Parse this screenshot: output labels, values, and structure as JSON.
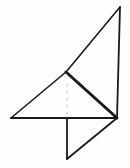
{
  "figure": {
    "type": "line-diagram",
    "background_color": "#fefefe",
    "stroke_color": "#1a1a1a",
    "faint_stroke_color": "#cccccc",
    "canvas": {
      "width": 130,
      "height": 168
    },
    "points": {
      "apex": {
        "x": 120,
        "y": 7,
        "label": "top apex"
      },
      "crease_mid": {
        "x": 66,
        "y": 72,
        "label": "middle crease junction"
      },
      "left": {
        "x": 11,
        "y": 118,
        "label": "left baseline vertex"
      },
      "right": {
        "x": 117,
        "y": 118,
        "label": "right baseline vertex"
      },
      "flap_top": {
        "x": 67,
        "y": 118,
        "label": "flap top vertex on baseline"
      },
      "flap_bottom": {
        "x": 67,
        "y": 159,
        "label": "flap bottom vertex"
      }
    },
    "strokes": [
      {
        "name": "long-diagonal-hypotenuse",
        "from": "apex",
        "to": "left",
        "via": "crease_mid",
        "width": 1.6,
        "style": "solid"
      },
      {
        "name": "right-vertical-edge",
        "from": "apex",
        "to": "right",
        "width": 1.8,
        "style": "solid"
      },
      {
        "name": "baseline-horizontal",
        "from": "left",
        "to": "right",
        "width": 1.8,
        "style": "solid"
      },
      {
        "name": "thick-crease-diagonal",
        "from": "crease_mid",
        "to": "right",
        "width": 3.0,
        "style": "solid"
      },
      {
        "name": "flap-vertical-edge",
        "from": "flap_top",
        "to": "flap_bottom",
        "width": 1.8,
        "style": "solid"
      },
      {
        "name": "flap-diagonal-edge",
        "from": "flap_bottom",
        "to": "right",
        "width": 1.8,
        "style": "solid"
      }
    ],
    "faint_marks": {
      "name": "interior-dotted-trace",
      "x": 67,
      "y_start": 84,
      "y_end": 112,
      "dot_count": 5
    }
  }
}
